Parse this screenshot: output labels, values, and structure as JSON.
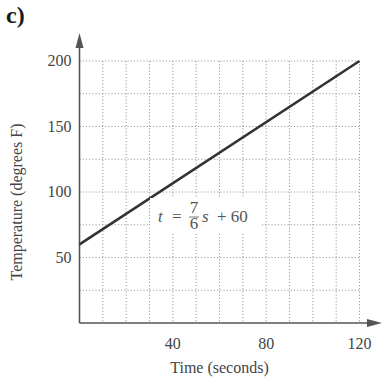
{
  "panel_label": "c)",
  "chart_data": {
    "type": "line",
    "title": "",
    "xlabel": "Time (seconds)",
    "ylabel": "Temperature (degrees F)",
    "xlim": [
      0,
      120
    ],
    "ylim": [
      0,
      200
    ],
    "x_ticks": [
      40,
      80,
      120
    ],
    "x_tick_labels": [
      "40",
      "80",
      "120"
    ],
    "y_ticks": [
      50,
      100,
      150,
      200
    ],
    "y_tick_labels": [
      "50",
      "100",
      "150",
      "200"
    ],
    "grid": {
      "on": true,
      "style": "dotted",
      "x_step": 10,
      "y_step": 25
    },
    "series": [
      {
        "name": "t = 7/6 s + 60",
        "x": [
          0,
          120
        ],
        "y": [
          60,
          200
        ]
      }
    ],
    "annotations": [
      {
        "text": "t = 7/6 s + 60",
        "x": 53,
        "y": 98
      }
    ],
    "legend": "none"
  },
  "equation": {
    "lhs": "t",
    "eq": "=",
    "num": "7",
    "den": "6",
    "var": "s",
    "rest": "+ 60"
  },
  "colors": {
    "line": "#333333",
    "axis": "#555555",
    "grid": "#9a9a9a"
  }
}
